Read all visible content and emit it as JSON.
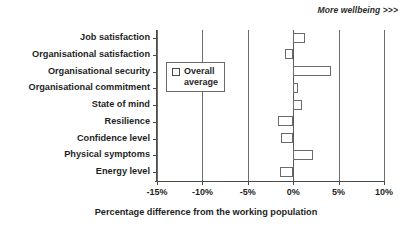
{
  "annotation": {
    "text": "More wellbeing >>>"
  },
  "legend": {
    "marker": "square-outline-icon",
    "label": "Overall\naverage"
  },
  "axis": {
    "x_title": "Percentage difference from the working population",
    "x_ticks": [
      "-15%",
      "-10%",
      "-5%",
      "0%",
      "5%",
      "10%"
    ]
  },
  "chart_data": {
    "type": "bar",
    "orientation": "horizontal",
    "title": "",
    "subtitle": "",
    "xlabel": "Percentage difference from the working population",
    "ylabel": "",
    "xlim": [
      -15,
      10
    ],
    "xticks": [
      -15,
      -10,
      -5,
      0,
      5,
      10
    ],
    "xtick_labels": [
      "-15%",
      "-10%",
      "-5%",
      "0%",
      "5%",
      "10%"
    ],
    "grid": true,
    "grid_axis": "x",
    "legend": {
      "position": "inside-left",
      "entries": [
        "Overall average"
      ]
    },
    "annotations": [
      {
        "text": "More wellbeing >>>",
        "position": "top-right",
        "style": "italic-bold"
      }
    ],
    "categories": [
      "Job satisfaction",
      "Organisational satisfaction",
      "Organisational security",
      "Organisational commitment",
      "State of mind",
      "Resilience",
      "Confidence level",
      "Physical symptoms",
      "Energy level"
    ],
    "series": [
      {
        "name": "Overall average",
        "values": [
          1.3,
          -0.9,
          4.2,
          0.5,
          1.0,
          -1.7,
          -1.3,
          2.2,
          -1.4
        ]
      }
    ]
  }
}
